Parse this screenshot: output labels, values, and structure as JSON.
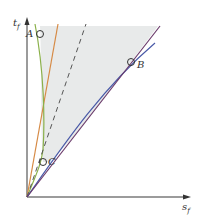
{
  "diagram": {
    "axes": {
      "y_label": "t",
      "y_label_sub": "f",
      "x_label": "s",
      "x_label_sub": "f",
      "color": "#7a7a7a"
    },
    "points": [
      {
        "label": "A",
        "x": 40,
        "y": 34
      },
      {
        "label": "B",
        "x": 131,
        "y": 62
      },
      {
        "label": "C",
        "x": 43,
        "y": 162
      }
    ],
    "curves": {
      "orange": "#d68a45",
      "green": "#8ab04a",
      "dashed": "#555555",
      "blue": "#4a5aa8",
      "purple": "#6a3a6a"
    },
    "shaded_region_color": "#e6e8e8"
  }
}
